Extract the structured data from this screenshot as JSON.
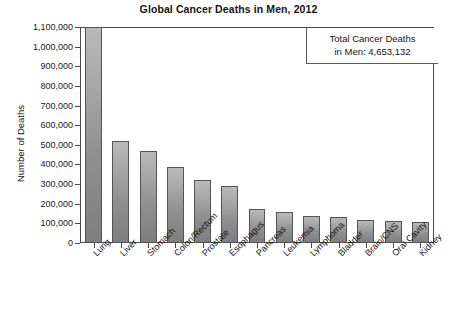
{
  "chart_data": {
    "type": "bar",
    "title": "Global Cancer Deaths in Men, 2012",
    "xlabel": "",
    "ylabel": "Number of Deaths",
    "ylim": [
      0,
      1100000
    ],
    "ytick_labels": [
      "1,100,000",
      "1,000,000",
      "900,000",
      "800,000",
      "700,000",
      "600,000",
      "500,000",
      "400,000",
      "300,000",
      "200,000",
      "100,000",
      "0"
    ],
    "ytick_values": [
      1100000,
      1000000,
      900000,
      800000,
      700000,
      600000,
      500000,
      400000,
      300000,
      200000,
      100000,
      0
    ],
    "grid": false,
    "legend": null,
    "categories": [
      "Lung",
      "Liver",
      "Stomach",
      "Colon/Rectum",
      "Prostate",
      "Esophagus",
      "Pancreas",
      "Leukemia",
      "Lymphoma",
      "Bladder",
      "Brain/CNS",
      "Oral Cavity",
      "Kidney"
    ],
    "values": [
      1100000,
      520000,
      470000,
      385000,
      320000,
      290000,
      175000,
      160000,
      140000,
      133000,
      115000,
      112000,
      105000
    ],
    "bar_color": "#9a9a9a",
    "bar_edge_color": "#545454",
    "annotation": {
      "line1": "Total Cancer Deaths",
      "line2": "in Men: 4,653,132",
      "total_value": 4653132
    }
  }
}
